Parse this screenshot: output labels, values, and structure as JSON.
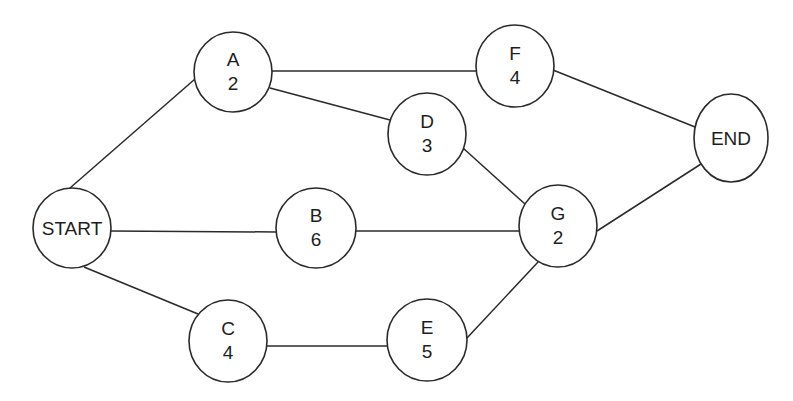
{
  "diagram": {
    "type": "activity-on-node network",
    "stroke_color": "#2a2a2a",
    "background": "#ffffff",
    "nodes": [
      {
        "id": "START",
        "label": "START",
        "duration": null,
        "cx": 72,
        "cy": 228,
        "rx": 39,
        "ry": 40
      },
      {
        "id": "A",
        "label": "A",
        "duration": "2",
        "cx": 233,
        "cy": 72,
        "rx": 39,
        "ry": 40
      },
      {
        "id": "B",
        "label": "B",
        "duration": "6",
        "cx": 316,
        "cy": 228,
        "rx": 40,
        "ry": 40
      },
      {
        "id": "C",
        "label": "C",
        "duration": "4",
        "cx": 228,
        "cy": 341,
        "rx": 39,
        "ry": 41
      },
      {
        "id": "D",
        "label": "D",
        "duration": "3",
        "cx": 427,
        "cy": 134,
        "rx": 39,
        "ry": 41
      },
      {
        "id": "E",
        "label": "E",
        "duration": "5",
        "cx": 427,
        "cy": 340,
        "rx": 40,
        "ry": 41
      },
      {
        "id": "F",
        "label": "F",
        "duration": "4",
        "cx": 515,
        "cy": 66,
        "rx": 39,
        "ry": 41
      },
      {
        "id": "G",
        "label": "G",
        "duration": "2",
        "cx": 558,
        "cy": 226,
        "rx": 39,
        "ry": 41
      },
      {
        "id": "END",
        "label": "END",
        "duration": null,
        "cx": 731,
        "cy": 138,
        "rx": 37,
        "ry": 44
      }
    ],
    "edges": [
      {
        "from": "START",
        "to": "A",
        "x1": 70,
        "y1": 188,
        "x2": 195,
        "y2": 79
      },
      {
        "from": "START",
        "to": "B",
        "x1": 111,
        "y1": 231,
        "x2": 276,
        "y2": 232
      },
      {
        "from": "START",
        "to": "C",
        "x1": 84,
        "y1": 267,
        "x2": 198,
        "y2": 314
      },
      {
        "from": "A",
        "to": "F",
        "x1": 272,
        "y1": 71,
        "x2": 476,
        "y2": 71
      },
      {
        "from": "A",
        "to": "D",
        "x1": 270,
        "y1": 88,
        "x2": 390,
        "y2": 120
      },
      {
        "from": "B",
        "to": "G",
        "x1": 356,
        "y1": 231,
        "x2": 520,
        "y2": 231
      },
      {
        "from": "C",
        "to": "E",
        "x1": 267,
        "y1": 346,
        "x2": 388,
        "y2": 346
      },
      {
        "from": "D",
        "to": "G",
        "x1": 463,
        "y1": 148,
        "x2": 525,
        "y2": 204
      },
      {
        "from": "E",
        "to": "G",
        "x1": 467,
        "y1": 338,
        "x2": 539,
        "y2": 261
      },
      {
        "from": "F",
        "to": "END",
        "x1": 553,
        "y1": 70,
        "x2": 695,
        "y2": 127
      },
      {
        "from": "G",
        "to": "END",
        "x1": 597,
        "y1": 231,
        "x2": 701,
        "y2": 164
      }
    ]
  }
}
